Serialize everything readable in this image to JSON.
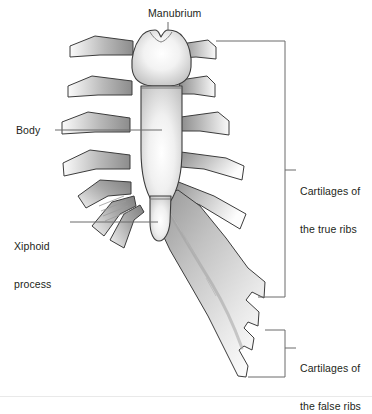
{
  "figure": {
    "background_color": "#ffffff",
    "outline_color": "#3a3a3a",
    "bone_light": "#ffffff",
    "bone_mid": "#d8d8d8",
    "bone_shadow": "#8e8e8e",
    "cartilage_dark": "#8a8a8a",
    "cartilage_light": "#f2f2f2",
    "leader_color": "#6b6b6b",
    "bracket_color": "#6b6b6b"
  },
  "labels": {
    "manubrium": "Manubrium",
    "body": "Body",
    "xiphoid_line1": "Xiphoid",
    "xiphoid_line2": "process",
    "true_ribs_line1": "Cartilages of",
    "true_ribs_line2": "the true ribs",
    "false_ribs_line1": "Cartilages of",
    "false_ribs_line2": "the false ribs"
  },
  "annotations": {
    "leader_manubrium": "leader line from Manubrium label down to manubrium bone",
    "leader_body": "horizontal leader line from Body label to sternum body",
    "leader_xiphoid": "horizontal leader line from Xiphoid process label to xiphoid tip",
    "bracket_true_ribs": "square bracket spanning the upper seven costal cartilages",
    "bracket_false_ribs": "square bracket spanning the lower costal margin cartilages"
  },
  "parts": {
    "manubrium": "Manubrium",
    "body": "Body",
    "xiphoid_process": "Xiphoid process",
    "true_rib_cartilages_count": 7,
    "false_rib_cartilages_count": 3
  }
}
